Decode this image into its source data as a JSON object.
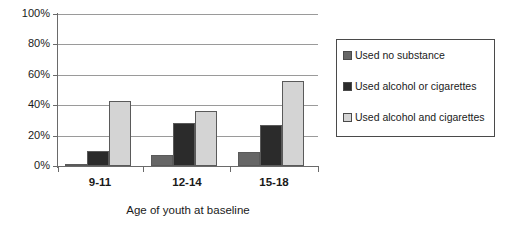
{
  "chart_data": {
    "type": "bar",
    "title": "",
    "subtitle": "",
    "xlabel": "Age of youth at baseline",
    "ylabel": "",
    "categories": [
      "9-11",
      "12-14",
      "15-18"
    ],
    "series": [
      {
        "name": "Used no substance",
        "values": [
          1,
          7,
          9
        ],
        "color": "#666666"
      },
      {
        "name": "Used alcohol or cigarettes",
        "values": [
          10,
          28,
          27
        ],
        "color": "#2b2b2b"
      },
      {
        "name": "Used alcohol and cigarettes",
        "values": [
          43,
          36,
          56
        ],
        "color": "#d4d4d4"
      }
    ],
    "ylim": [
      0,
      100
    ],
    "ytick_values": [
      0,
      20,
      40,
      60,
      80,
      100
    ],
    "ytick_labels": [
      "0%",
      "20%",
      "40%",
      "60%",
      "80%",
      "100%"
    ],
    "grid": true,
    "grid_axis": "y",
    "legend_position": "right",
    "value_unit": "percent",
    "bar_border_color": "#5a5a5a",
    "axis_color": "#6a6a6a",
    "gridline_color": "#9a9a9a",
    "background_color": "#ffffff"
  },
  "legend": {
    "entries": [
      {
        "label": "Used no substance",
        "color": "#666666"
      },
      {
        "label": "Used alcohol or cigarettes",
        "color": "#2b2b2b"
      },
      {
        "label": "Used alcohol and cigarettes",
        "color": "#d4d4d4"
      }
    ]
  },
  "axes": {
    "y": {
      "labels": [
        "100%",
        "80%",
        "60%",
        "40%",
        "20%",
        "0%"
      ]
    },
    "x": {
      "labels": [
        "9-11",
        "12-14",
        "15-18"
      ],
      "title": "Age of youth at baseline"
    }
  }
}
